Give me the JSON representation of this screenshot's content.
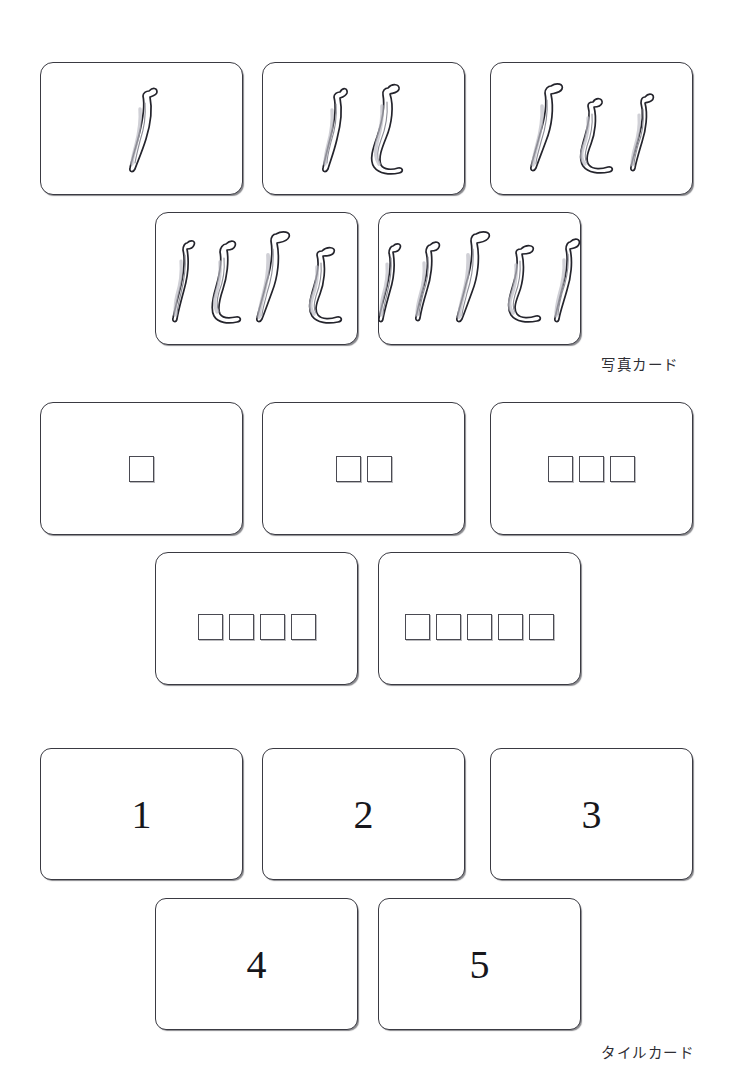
{
  "page": {
    "background_color": "#ffffff",
    "ink_color": "#3a3a42"
  },
  "sections": [
    {
      "id": "photo",
      "caption": "写真カード",
      "card_type": "photo",
      "cards": [
        {
          "count": 1,
          "label": "バナナ1本の写真カード"
        },
        {
          "count": 2,
          "label": "バナナ2本の写真カード"
        },
        {
          "count": 3,
          "label": "バナナ3本の写真カード"
        },
        {
          "count": 4,
          "label": "バナナ4本の写真カード"
        },
        {
          "count": 5,
          "label": "バナナ5本の写真カード"
        }
      ]
    },
    {
      "id": "tile",
      "caption": "タイルカード",
      "card_type": "tile",
      "cards": [
        {
          "count": 1,
          "label": "タイル1個のカード"
        },
        {
          "count": 2,
          "label": "タイル2個のカード"
        },
        {
          "count": 3,
          "label": "タイル3個のカード"
        },
        {
          "count": 4,
          "label": "タイル4個のカード"
        },
        {
          "count": 5,
          "label": "タイル5個のカード"
        }
      ]
    },
    {
      "id": "number",
      "caption": "数字カード",
      "card_type": "number",
      "cards": [
        {
          "count": 1,
          "numeral": "1",
          "label": "数字1のカード"
        },
        {
          "count": 2,
          "numeral": "2",
          "label": "数字2のカード"
        },
        {
          "count": 3,
          "numeral": "3",
          "label": "数字3のカード"
        },
        {
          "count": 4,
          "numeral": "4",
          "label": "数字4のカード"
        },
        {
          "count": 5,
          "numeral": "5",
          "label": "数字5のカード"
        }
      ]
    }
  ]
}
